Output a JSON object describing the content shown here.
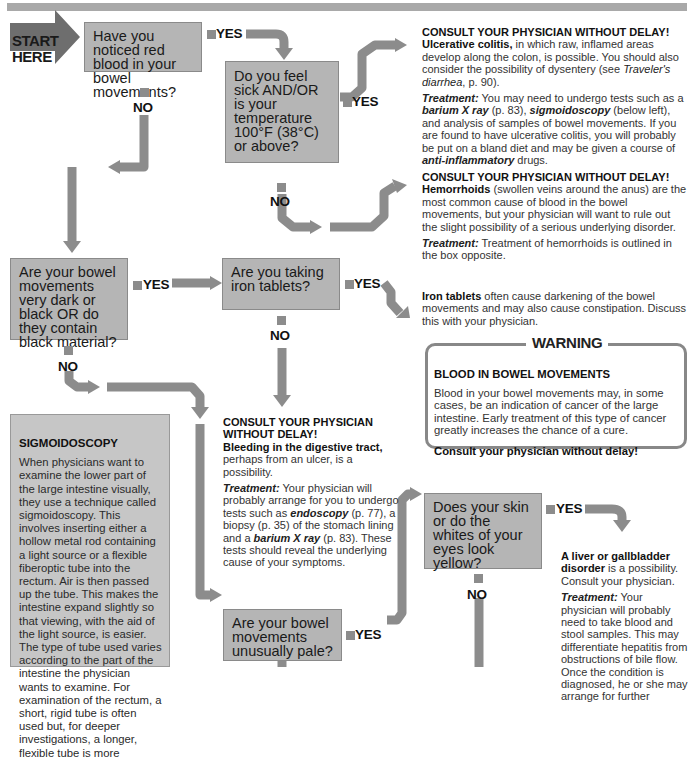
{
  "colors": {
    "question_fill": "#b5b5b5",
    "question_border": "#8a8a8a",
    "arrow": "#8c8c8c",
    "start_arrow": "#6e6e6e",
    "sidebar_fill": "#c6c6c6",
    "top_bar": "#a9a9a9"
  },
  "start": {
    "line1": "START",
    "line2": "HERE"
  },
  "labels": {
    "yes": "YES",
    "no": "NO"
  },
  "questions": [
    {
      "id": "q1",
      "text": "Have you noticed red blood in your bowel movements?"
    },
    {
      "id": "q2",
      "text": "Do you feel sick AND/OR is your temperature 100°F (38°C) or above?"
    },
    {
      "id": "q3",
      "text": "Are your bowel movements very dark or black OR do they contain black material?"
    },
    {
      "id": "q4",
      "text": "Are you taking iron tablets?"
    },
    {
      "id": "q5",
      "text": "Does your skin or do the whites of your eyes look yellow?"
    },
    {
      "id": "q6",
      "text": "Are your bowel movements unusually pale?"
    }
  ],
  "outcomes": {
    "ulcerative": {
      "heading": "CONSULT YOUR PHYSICIAN WITHOUT DELAY!",
      "bold": "Ulcerative colitis,",
      "body1": " in which raw, inflamed areas develop along the colon, is possible. You should also consider the possibility of dysentery (see ",
      "italic1": "Traveler's diarrhea",
      "body2": ", p. 90).",
      "treatment_label": "Treatment:",
      "t1": " You may need to undergo tests such as a ",
      "ti1": "barium X ray",
      "t2": " (p. 83), ",
      "ti2": "sigmoidoscopy",
      "t3": " (below left), and analysis of samples of bowel movements. If you are found to have ulcerative colitis, you will probably be put on a bland diet and may be given a course of ",
      "ti3": "anti-inflammatory",
      "t4": " drugs."
    },
    "hemorrhoids": {
      "heading": "CONSULT YOUR PHYSICIAN WITHOUT DELAY!",
      "bold": "Hemorrhoids",
      "body": " (swollen veins around the anus) are the most common cause of blood in the bowel movements, but your physician will want to rule out the slight possibility of a serious underlying disorder.",
      "treatment_label": "Treatment:",
      "treatment": " Treatment of hemorrhoids is outlined in the box opposite."
    },
    "iron": {
      "bold": "Iron tablets",
      "body": " often cause darkening of the bowel movements and may also cause constipation. Discuss this with your physician."
    },
    "bleeding": {
      "heading": "CONSULT YOUR PHYSICIAN WITHOUT DELAY!",
      "bold": "Bleeding in the digestive tract,",
      "body": " perhaps from an ulcer, is a possibility.",
      "treatment_label": "Treatment:",
      "t1": " Your physician will probably arrange for you to undergo tests such as ",
      "ti1": "endoscopy",
      "t2": " (p. 77), a biopsy (p. 35) of the stomach lining and a ",
      "ti2": "barium X ray",
      "t3": " (p. 83). These tests should reveal the underlying cause of your symptoms."
    },
    "liver": {
      "bold": "A liver or gallbladder disorder",
      "body": " is a possibility. Consult your physician.",
      "treatment_label": "Treatment:",
      "treatment": " Your physician will probably need to take blood and stool samples. This may differentiate hepatitis from obstructions of bile flow. Once the condition is diagnosed, he or she may arrange for further"
    }
  },
  "warning": {
    "title": "WARNING",
    "heading": "BLOOD IN BOWEL MOVEMENTS",
    "body": "Blood in your bowel movements may, in some cases, be an indication of cancer of the large intestine. Early treatment of this type of cancer greatly increases the chance of a cure.",
    "footer": "Consult your physician without delay!"
  },
  "sidebar": {
    "title": "SIGMOIDOSCOPY",
    "body": "When physicians want to examine the lower part of the large intestine visually, they use a technique called sigmoidoscopy. This involves inserting either a hollow metal rod containing a light source or a flexible fiberoptic tube into the rectum. Air is then passed up the tube. This makes the intestine expand slightly so that viewing, with the aid of the light source, is easier. The type of tube used varies according to the part of the intestine the physician wants to examine. For examination of the rectum, a short, rigid tube is often used but, for deeper investigations, a longer, flexible tube is more"
  }
}
